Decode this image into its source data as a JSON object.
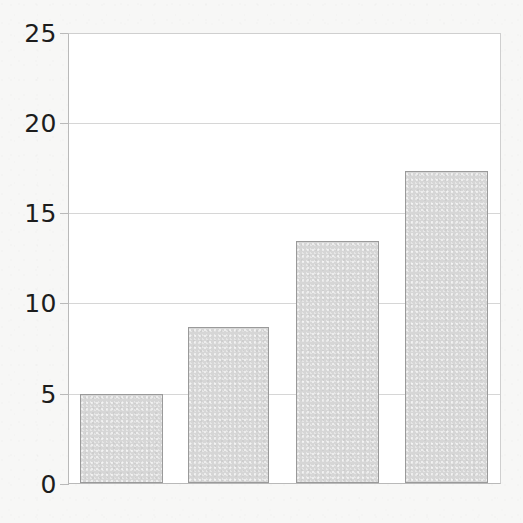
{
  "chart_data": {
    "type": "bar",
    "title": "",
    "subtitle": "",
    "xlabel": "",
    "ylabel": "",
    "categories": [
      "",
      "",
      "",
      ""
    ],
    "values": [
      4.95,
      8.7,
      13.5,
      17.4
    ],
    "ylim": [
      0,
      25
    ],
    "yticks": [
      0,
      5,
      10,
      15,
      20,
      25
    ],
    "ytick_labels": [
      "0",
      "5",
      "10",
      "15",
      "20",
      "25"
    ],
    "xticks": [],
    "xtick_labels": [],
    "grid": "horizontal",
    "legend": "none",
    "annotations": [],
    "series": [
      {
        "name": "",
        "values": [
          4.95,
          8.7,
          13.5,
          17.4
        ]
      }
    ]
  },
  "style": {
    "page_background": "#f7f7f6",
    "plot_background": "#ffffff",
    "bar_fill": "#d6d6d6",
    "bar_border": "#9a9a9a",
    "gridline_color": "#d6d6d6",
    "axis_color": "#b9b9b9",
    "tick_label_color": "#1d1d1d"
  }
}
